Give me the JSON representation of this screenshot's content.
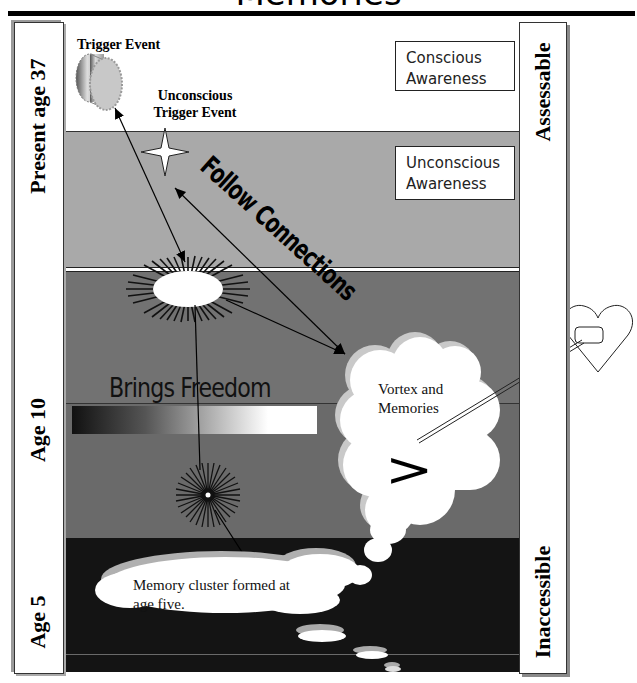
{
  "title": "Memories",
  "left_column": {
    "labels": [
      {
        "text": "Present age 37",
        "arrow": "down-double-arrow"
      },
      {
        "text": "Age 10"
      },
      {
        "text": "Age 5"
      }
    ]
  },
  "right_column": {
    "labels": [
      {
        "text": "Assessable",
        "arrow": "down-double-arrow"
      },
      {
        "text": "Inaccessible"
      }
    ]
  },
  "bands": [
    {
      "name": "conscious",
      "color": "#ffffff"
    },
    {
      "name": "unconscious",
      "color": "#a9a9a9"
    },
    {
      "name": "age-10-upper",
      "color": "#727272"
    },
    {
      "name": "age-10-lower",
      "color": "#6a6a6a"
    },
    {
      "name": "age-5",
      "color": "#141414"
    }
  ],
  "boxes": {
    "conscious": [
      "Conscious",
      "Awareness"
    ],
    "unconscious": [
      "Unconscious",
      "Awareness"
    ]
  },
  "annotations": {
    "trigger_event": "Trigger Event",
    "unconscious_trigger_line1": "Unconscious",
    "unconscious_trigger_line2": "Trigger Event",
    "follow_connections": "Follow Connections",
    "brings_freedom": "Brings Freedom",
    "vortex_line1": "Vortex and",
    "vortex_line2": "Memories",
    "memory_cluster_line1": "Memory cluster formed at",
    "memory_cluster_line2": "age five.",
    "vortex_symbol": ">"
  },
  "icons": [
    "cylinder-gear-icon",
    "four-point-star-icon",
    "sunburst-icon",
    "small-sunburst-icon",
    "thought-cloud-icon",
    "heart-icon"
  ]
}
